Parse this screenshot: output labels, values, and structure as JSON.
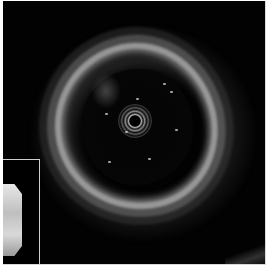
{
  "image": {
    "kind": "intravascular ultrasound cross-section",
    "width": 268,
    "height": 266,
    "colors": {
      "background": "#020202",
      "vessel_wall": "#d2d2d2",
      "lumen": "#050505",
      "frame_border": "#d8d8d8"
    }
  },
  "inset": {
    "kind": "longitudinal view thumbnail"
  }
}
